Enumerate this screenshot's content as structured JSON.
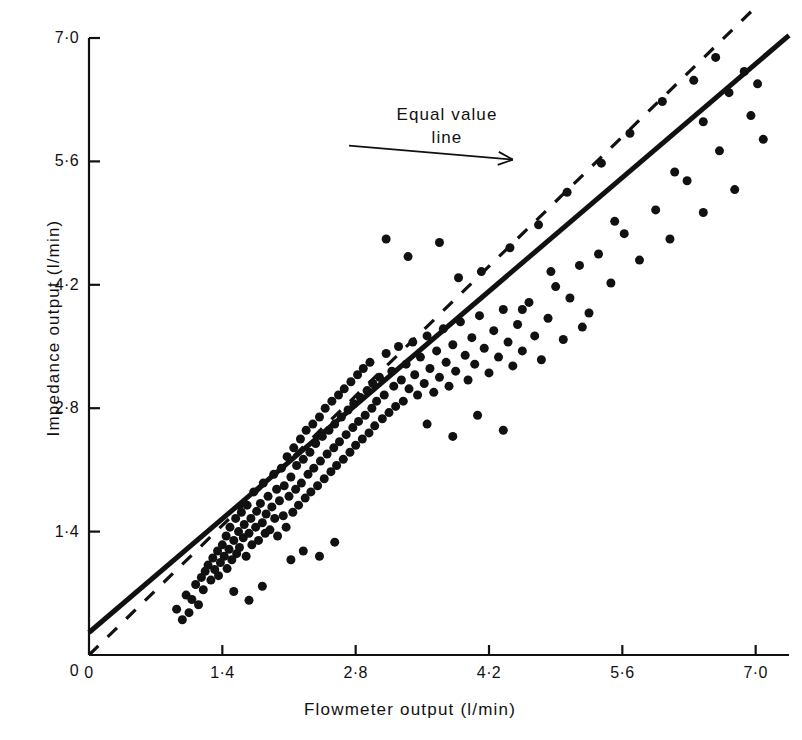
{
  "figure": {
    "background": "#ffffff",
    "ink": "#111111"
  },
  "axes": {
    "x": {
      "label": "Flowmeter  output  (l/min)",
      "ticks": [
        "0",
        "1·4",
        "2·8",
        "4·2",
        "5·6",
        "7·0"
      ],
      "tick_values": [
        0,
        1.4,
        2.8,
        4.2,
        5.6,
        7.0
      ],
      "range": [
        0,
        7.35
      ]
    },
    "y": {
      "label": "Impedance  output  (l/min)",
      "ticks": [
        "0",
        "1·4",
        "2·8",
        "4·2",
        "5·6",
        "7·0"
      ],
      "tick_values": [
        0,
        1.4,
        2.8,
        4.2,
        5.6,
        7.0
      ],
      "range": [
        0,
        7.0
      ]
    }
  },
  "annotations": [
    {
      "name": "equal-value-line-label",
      "line1": "Equal value",
      "line2": "line",
      "arrow": {
        "x1": 2.73,
        "y1": 5.78,
        "x2": 4.45,
        "y2": 5.62
      }
    }
  ],
  "chart_data": {
    "type": "scatter",
    "title": "",
    "xlabel": "Flowmeter  output  (l/min)",
    "ylabel": "Impedance  output  (l/min)",
    "xlim": [
      0,
      7.35
    ],
    "ylim": [
      0,
      7.0
    ],
    "grid": false,
    "legend": "none",
    "marker": {
      "shape": "circle",
      "color": "#111111",
      "size": 9
    },
    "series": [
      {
        "name": "Impedance vs flowmeter cardiac output",
        "points": [
          [
            0.92,
            0.52
          ],
          [
            0.98,
            0.4
          ],
          [
            1.02,
            0.68
          ],
          [
            1.08,
            0.63
          ],
          [
            1.12,
            0.8
          ],
          [
            1.15,
            0.57
          ],
          [
            1.18,
            0.88
          ],
          [
            1.2,
            0.74
          ],
          [
            1.22,
            0.95
          ],
          [
            1.25,
            1.02
          ],
          [
            1.28,
            0.85
          ],
          [
            1.3,
            1.1
          ],
          [
            1.32,
            0.97
          ],
          [
            1.35,
            1.18
          ],
          [
            1.36,
            0.9
          ],
          [
            1.38,
            1.05
          ],
          [
            1.4,
            1.25
          ],
          [
            1.42,
            1.12
          ],
          [
            1.44,
            1.35
          ],
          [
            1.45,
            0.98
          ],
          [
            1.47,
            1.2
          ],
          [
            1.48,
            1.45
          ],
          [
            1.5,
            1.08
          ],
          [
            1.52,
            1.3
          ],
          [
            1.54,
            1.55
          ],
          [
            1.55,
            1.15
          ],
          [
            1.57,
            1.4
          ],
          [
            1.58,
            1.22
          ],
          [
            1.6,
            1.62
          ],
          [
            1.62,
            1.33
          ],
          [
            1.63,
            1.48
          ],
          [
            1.65,
            1.12
          ],
          [
            1.66,
            1.7
          ],
          [
            1.68,
            1.38
          ],
          [
            1.7,
            1.55
          ],
          [
            1.71,
            1.25
          ],
          [
            1.73,
            1.85
          ],
          [
            1.75,
            1.45
          ],
          [
            1.76,
            1.63
          ],
          [
            1.78,
            1.3
          ],
          [
            1.8,
            1.72
          ],
          [
            1.82,
            1.5
          ],
          [
            1.83,
            1.95
          ],
          [
            1.85,
            1.38
          ],
          [
            1.86,
            1.6
          ],
          [
            1.88,
            1.8
          ],
          [
            1.9,
            1.42
          ],
          [
            1.92,
            1.68
          ],
          [
            1.94,
            2.05
          ],
          [
            1.95,
            1.55
          ],
          [
            1.97,
            1.88
          ],
          [
            1.98,
            1.35
          ],
          [
            2.0,
            1.75
          ],
          [
            2.02,
            2.12
          ],
          [
            2.04,
            1.58
          ],
          [
            2.05,
            1.92
          ],
          [
            2.07,
            1.45
          ],
          [
            2.08,
            2.25
          ],
          [
            2.1,
            1.8
          ],
          [
            2.12,
            2.02
          ],
          [
            2.14,
            1.62
          ],
          [
            2.15,
            2.35
          ],
          [
            2.17,
            1.88
          ],
          [
            2.18,
            2.15
          ],
          [
            2.2,
            1.7
          ],
          [
            2.22,
            2.45
          ],
          [
            2.23,
            1.95
          ],
          [
            2.25,
            2.22
          ],
          [
            2.27,
            1.78
          ],
          [
            2.28,
            2.55
          ],
          [
            2.3,
            2.05
          ],
          [
            2.32,
            2.3
          ],
          [
            2.33,
            1.85
          ],
          [
            2.35,
            2.62
          ],
          [
            2.36,
            2.12
          ],
          [
            2.38,
            2.4
          ],
          [
            2.4,
            1.92
          ],
          [
            2.42,
            2.7
          ],
          [
            2.43,
            2.2
          ],
          [
            2.45,
            2.48
          ],
          [
            2.47,
            2.0
          ],
          [
            2.48,
            2.8
          ],
          [
            2.5,
            2.28
          ],
          [
            2.52,
            2.55
          ],
          [
            2.54,
            2.08
          ],
          [
            2.55,
            2.88
          ],
          [
            2.57,
            2.35
          ],
          [
            2.58,
            2.62
          ],
          [
            2.6,
            2.15
          ],
          [
            2.62,
            2.95
          ],
          [
            2.63,
            2.42
          ],
          [
            2.65,
            2.7
          ],
          [
            2.67,
            2.22
          ],
          [
            2.68,
            3.02
          ],
          [
            2.7,
            2.5
          ],
          [
            2.72,
            2.78
          ],
          [
            2.74,
            2.3
          ],
          [
            2.75,
            3.1
          ],
          [
            2.77,
            2.58
          ],
          [
            2.78,
            2.85
          ],
          [
            2.8,
            2.38
          ],
          [
            2.82,
            3.18
          ],
          [
            2.83,
            2.65
          ],
          [
            2.85,
            2.92
          ],
          [
            2.87,
            2.45
          ],
          [
            2.88,
            3.25
          ],
          [
            2.9,
            2.72
          ],
          [
            2.92,
            3.0
          ],
          [
            2.94,
            2.52
          ],
          [
            2.95,
            3.32
          ],
          [
            2.97,
            2.8
          ],
          [
            2.98,
            3.08
          ],
          [
            3.0,
            2.6
          ],
          [
            3.02,
            2.88
          ],
          [
            3.05,
            3.15
          ],
          [
            3.08,
            2.68
          ],
          [
            3.1,
            2.95
          ],
          [
            3.12,
            3.42
          ],
          [
            3.15,
            2.75
          ],
          [
            3.18,
            3.22
          ],
          [
            3.2,
            3.05
          ],
          [
            3.22,
            2.82
          ],
          [
            3.25,
            3.5
          ],
          [
            3.28,
            3.12
          ],
          [
            3.3,
            2.88
          ],
          [
            3.33,
            3.3
          ],
          [
            3.36,
            3.02
          ],
          [
            3.4,
            3.55
          ],
          [
            3.42,
            3.18
          ],
          [
            3.45,
            2.95
          ],
          [
            3.48,
            3.38
          ],
          [
            3.52,
            3.08
          ],
          [
            3.55,
            3.62
          ],
          [
            3.58,
            3.25
          ],
          [
            3.62,
            2.98
          ],
          [
            3.65,
            3.45
          ],
          [
            3.68,
            3.15
          ],
          [
            3.72,
            3.7
          ],
          [
            3.75,
            3.32
          ],
          [
            3.78,
            3.05
          ],
          [
            3.82,
            3.52
          ],
          [
            3.85,
            3.22
          ],
          [
            3.9,
            3.78
          ],
          [
            3.95,
            3.4
          ],
          [
            3.98,
            3.12
          ],
          [
            4.02,
            3.6
          ],
          [
            4.05,
            3.3
          ],
          [
            4.1,
            3.85
          ],
          [
            4.15,
            3.48
          ],
          [
            4.2,
            3.2
          ],
          [
            4.25,
            3.68
          ],
          [
            4.3,
            3.38
          ],
          [
            4.35,
            3.92
          ],
          [
            4.4,
            3.55
          ],
          [
            4.45,
            3.28
          ],
          [
            4.5,
            3.75
          ],
          [
            4.55,
            3.45
          ],
          [
            4.62,
            4.0
          ],
          [
            4.68,
            3.62
          ],
          [
            4.75,
            3.35
          ],
          [
            4.82,
            3.82
          ],
          [
            4.9,
            4.18
          ],
          [
            4.98,
            3.58
          ],
          [
            5.05,
            4.05
          ],
          [
            5.15,
            4.42
          ],
          [
            5.25,
            3.88
          ],
          [
            5.35,
            4.55
          ],
          [
            5.48,
            4.22
          ],
          [
            5.62,
            4.78
          ],
          [
            5.78,
            4.48
          ],
          [
            5.95,
            5.05
          ],
          [
            6.1,
            4.72
          ],
          [
            6.28,
            5.38
          ],
          [
            6.45,
            5.02
          ],
          [
            6.62,
            5.72
          ],
          [
            6.78,
            5.28
          ],
          [
            6.95,
            6.12
          ],
          [
            7.08,
            5.85
          ],
          [
            3.12,
            4.72
          ],
          [
            3.35,
            4.52
          ],
          [
            3.68,
            4.68
          ],
          [
            3.88,
            4.28
          ],
          [
            4.12,
            4.35
          ],
          [
            4.42,
            4.62
          ],
          [
            4.72,
            4.88
          ],
          [
            5.02,
            5.25
          ],
          [
            5.38,
            5.58
          ],
          [
            5.68,
            5.92
          ],
          [
            6.02,
            6.28
          ],
          [
            6.35,
            6.52
          ],
          [
            6.58,
            6.78
          ],
          [
            6.88,
            6.62
          ],
          [
            3.55,
            2.62
          ],
          [
            3.82,
            2.48
          ],
          [
            4.08,
            2.72
          ],
          [
            4.35,
            2.55
          ],
          [
            2.12,
            1.08
          ],
          [
            2.25,
            1.18
          ],
          [
            2.42,
            1.12
          ],
          [
            2.58,
            1.28
          ],
          [
            1.52,
            0.72
          ],
          [
            1.68,
            0.62
          ],
          [
            1.82,
            0.78
          ],
          [
            1.05,
            0.48
          ],
          [
            4.55,
            3.92
          ],
          [
            4.85,
            4.35
          ],
          [
            5.18,
            3.72
          ],
          [
            5.52,
            4.92
          ],
          [
            6.15,
            5.48
          ],
          [
            6.45,
            6.05
          ],
          [
            6.72,
            6.38
          ],
          [
            7.02,
            6.48
          ]
        ]
      }
    ],
    "lines": [
      {
        "name": "regression-line",
        "style": "solid",
        "color": "#111111",
        "width": 5,
        "x1": 0.0,
        "y1": 0.255,
        "x2": 7.35,
        "y2": 7.03
      },
      {
        "name": "equal-value-line",
        "style": "dashed",
        "color": "#111111",
        "width": 3.2,
        "dash": "13 13",
        "x1": 0.0,
        "y1": 0.0,
        "x2": 7.0,
        "y2": 7.35
      }
    ]
  }
}
